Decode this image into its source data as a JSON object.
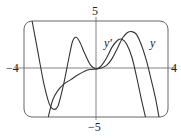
{
  "chart_data": {
    "type": "line",
    "title": "",
    "xlabel": "",
    "ylabel": "",
    "xlim": [
      -4,
      4
    ],
    "ylim": [
      -5,
      5
    ],
    "grid": false,
    "tick_labels": {
      "x_min": "−4",
      "x_max": "4",
      "y_max": "5",
      "y_min": "−5"
    },
    "series": [
      {
        "name": "y'",
        "label": "y′",
        "points": [
          [
            -3.55,
            5
          ],
          [
            -3.2,
            1.5
          ],
          [
            -2.9,
            -1.5
          ],
          [
            -2.6,
            -3.6
          ],
          [
            -2.35,
            -4.2
          ],
          [
            -2.1,
            -3.8
          ],
          [
            -1.8,
            -1.6
          ],
          [
            -1.5,
            1.2
          ],
          [
            -1.3,
            2.9
          ],
          [
            -1.1,
            3.3
          ],
          [
            -0.9,
            2.8
          ],
          [
            -0.6,
            1.5
          ],
          [
            -0.3,
            0.4
          ],
          [
            0,
            0
          ],
          [
            0.3,
            0.35
          ],
          [
            0.6,
            1.2
          ],
          [
            0.9,
            2.3
          ],
          [
            1.2,
            3.0
          ],
          [
            1.45,
            3.1
          ],
          [
            1.7,
            2.6
          ],
          [
            2.0,
            1.2
          ],
          [
            2.3,
            -1.2
          ],
          [
            2.55,
            -3.4
          ],
          [
            2.75,
            -5
          ]
        ]
      },
      {
        "name": "y",
        "label": "y",
        "points": [
          [
            -2.65,
            -5
          ],
          [
            -2.4,
            -3.2
          ],
          [
            -2.1,
            -2.2
          ],
          [
            -1.8,
            -1.6
          ],
          [
            -1.4,
            -1.1
          ],
          [
            -1.0,
            -0.6
          ],
          [
            -0.6,
            -0.2
          ],
          [
            -0.3,
            -0.05
          ],
          [
            0,
            0
          ],
          [
            0.3,
            0.1
          ],
          [
            0.6,
            0.4
          ],
          [
            0.9,
            1.1
          ],
          [
            1.2,
            2.2
          ],
          [
            1.5,
            3.3
          ],
          [
            1.75,
            3.8
          ],
          [
            2.0,
            3.9
          ],
          [
            2.25,
            3.6
          ],
          [
            2.5,
            2.6
          ],
          [
            2.8,
            0.9
          ],
          [
            3.05,
            -1.0
          ],
          [
            3.3,
            -3.0
          ],
          [
            3.5,
            -5
          ]
        ]
      }
    ],
    "annotations": [
      {
        "text": "y′",
        "x": 1.3,
        "y": 2.7
      },
      {
        "text": "y",
        "x": 3.1,
        "y": 2.7
      }
    ]
  },
  "axes": {
    "y_top": "5",
    "y_bottom": "−5",
    "x_left": "−4",
    "x_right": "4"
  },
  "labels": {
    "yprime": "y′",
    "y": "y"
  },
  "colors": {
    "curve": "#333333",
    "axis": "#666666",
    "frame": "#555555"
  }
}
